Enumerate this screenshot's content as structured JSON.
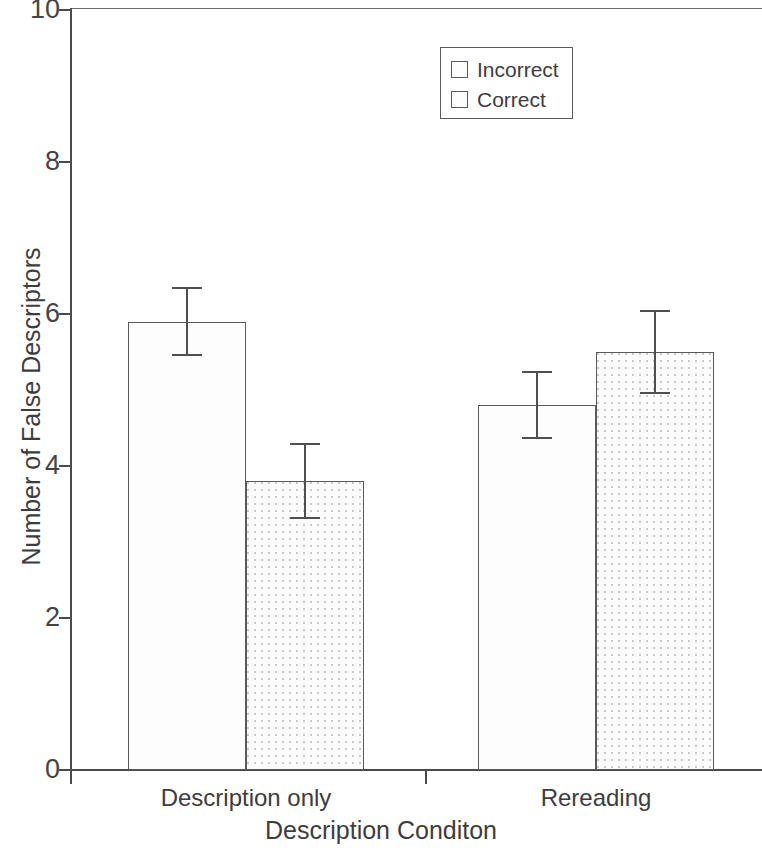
{
  "chart_data": {
    "type": "bar",
    "title": "",
    "xlabel": "Description Conditon",
    "ylabel": "Number of False Descriptors",
    "categories": [
      "Description only",
      "Rereading"
    ],
    "ylim": [
      0,
      10
    ],
    "yticks": [
      0,
      2,
      4,
      6,
      8,
      10
    ],
    "ytick_labels": [
      "0",
      "2",
      "4",
      "6",
      "8",
      "10"
    ],
    "grid": false,
    "legend_position": "top-center",
    "series": [
      {
        "name": "Incorrect",
        "fill": "plain-light",
        "values": [
          5.9,
          4.8
        ],
        "error_upper": [
          0.45,
          0.45
        ],
        "error_lower": [
          0.45,
          0.45
        ]
      },
      {
        "name": "Correct",
        "fill": "dotted",
        "values": [
          3.8,
          5.5
        ],
        "error_upper": [
          0.5,
          0.55
        ],
        "error_lower": [
          0.5,
          0.55
        ]
      }
    ]
  },
  "legend": {
    "items": [
      {
        "label": "Incorrect"
      },
      {
        "label": "Correct"
      }
    ]
  },
  "colors": {
    "axis": "#4a4a4a",
    "bar_outline": "#5a5a5a",
    "text": "#3d3d3d",
    "incorrect_fill": "#fdfdfd",
    "correct_fill": "#fcfcfc",
    "correct_dot": "#c9c9cf"
  }
}
